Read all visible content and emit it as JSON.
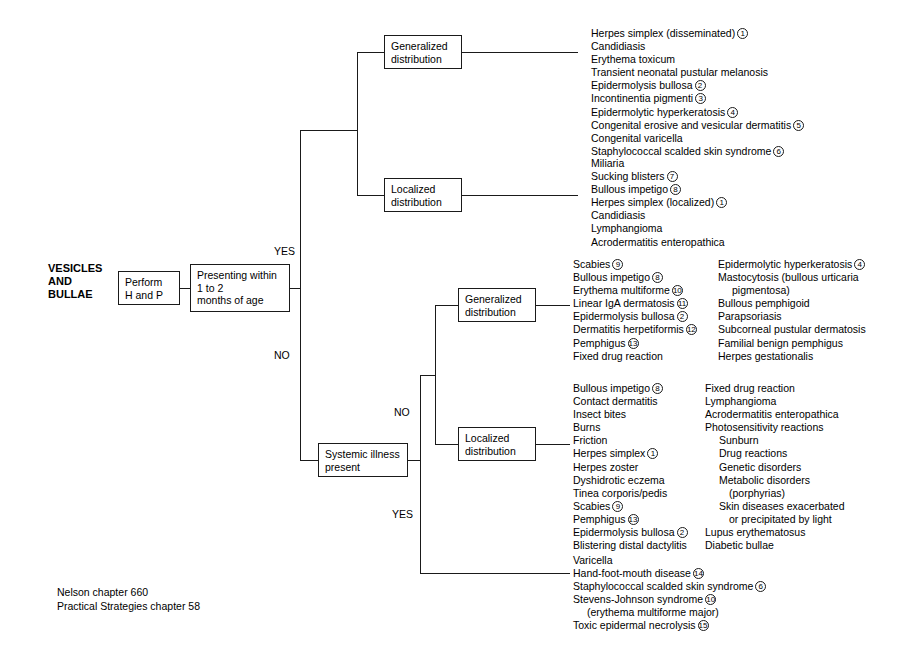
{
  "title_label": "VESICLES\nAND\nBULLAE",
  "nodes": {
    "perform": "Perform\nH and P",
    "presenting": "Presenting within\n1 to 2\nmonths of age",
    "systemic": "Systemic illness\npresent",
    "gen_dist_top": "Generalized\ndistribution",
    "loc_dist_top": "Localized\ndistribution",
    "gen_dist_mid": "Generalized\ndistribution",
    "loc_dist_mid": "Localized\ndistribution"
  },
  "branch_labels": {
    "yes_top": "YES",
    "no_top": "NO",
    "no_mid": "NO",
    "yes_bottom": "YES"
  },
  "lists": {
    "neonatal_generalized": [
      {
        "text": "Herpes simplex (disseminated)",
        "ref": "1",
        "indent": 0
      },
      {
        "text": "Candidiasis",
        "ref": "",
        "indent": 0
      },
      {
        "text": "Erythema toxicum",
        "ref": "",
        "indent": 0
      },
      {
        "text": "Transient neonatal pustular melanosis",
        "ref": "",
        "indent": 0
      },
      {
        "text": "Epidermolysis bullosa",
        "ref": "2",
        "indent": 0
      },
      {
        "text": "Incontinentia pigmenti",
        "ref": "3",
        "indent": 0
      },
      {
        "text": "Epidermolytic hyperkeratosis",
        "ref": "4",
        "indent": 0
      },
      {
        "text": "Congenital erosive and vesicular dermatitis",
        "ref": "5",
        "indent": 0
      },
      {
        "text": "Congenital varicella",
        "ref": "",
        "indent": 0
      },
      {
        "text": "Staphylococcal scalded skin syndrome",
        "ref": "6",
        "indent": 0
      }
    ],
    "neonatal_localized": [
      {
        "text": "Miliaria",
        "ref": "",
        "indent": 0
      },
      {
        "text": "Sucking blisters",
        "ref": "7",
        "indent": 0
      },
      {
        "text": "Bullous impetigo",
        "ref": "8",
        "indent": 0
      },
      {
        "text": "Herpes simplex (localized)",
        "ref": "1",
        "indent": 0
      },
      {
        "text": "Candidiasis",
        "ref": "",
        "indent": 0
      },
      {
        "text": "Lymphangioma",
        "ref": "",
        "indent": 0
      },
      {
        "text": "Acrodermatitis enteropathica",
        "ref": "",
        "indent": 0
      }
    ],
    "generalized_left": [
      {
        "text": "Scabies",
        "ref": "9",
        "indent": 0
      },
      {
        "text": "Bullous impetigo",
        "ref": "8",
        "indent": 0
      },
      {
        "text": "Erythema multiforme",
        "ref": "10",
        "indent": 0
      },
      {
        "text": "Linear IgA dermatosis",
        "ref": "11",
        "indent": 0
      },
      {
        "text": "Epidermolysis bullosa",
        "ref": "2",
        "indent": 0
      },
      {
        "text": "Dermatitis herpetiformis",
        "ref": "12",
        "indent": 0
      },
      {
        "text": "Pemphigus",
        "ref": "13",
        "indent": 0
      },
      {
        "text": "Fixed drug reaction",
        "ref": "",
        "indent": 0
      }
    ],
    "generalized_right": [
      {
        "text": "Epidermolytic hyperkeratosis",
        "ref": "4",
        "indent": 0
      },
      {
        "text": "Mastocytosis (bullous urticaria",
        "ref": "",
        "indent": 0
      },
      {
        "text": "pigmentosa)",
        "ref": "",
        "indent": 1
      },
      {
        "text": "Bullous pemphigoid",
        "ref": "",
        "indent": 0
      },
      {
        "text": "Parapsoriasis",
        "ref": "",
        "indent": 0
      },
      {
        "text": "Subcorneal pustular dermatosis",
        "ref": "",
        "indent": 0
      },
      {
        "text": "Familial benign pemphigus",
        "ref": "",
        "indent": 0
      },
      {
        "text": "Herpes gestationalis",
        "ref": "",
        "indent": 0
      }
    ],
    "localized_left": [
      {
        "text": "Bullous impetigo",
        "ref": "8",
        "indent": 0
      },
      {
        "text": "Contact dermatitis",
        "ref": "",
        "indent": 0
      },
      {
        "text": "Insect bites",
        "ref": "",
        "indent": 0
      },
      {
        "text": "Burns",
        "ref": "",
        "indent": 0
      },
      {
        "text": "Friction",
        "ref": "",
        "indent": 0
      },
      {
        "text": "Herpes simplex",
        "ref": "1",
        "indent": 0
      },
      {
        "text": "Herpes zoster",
        "ref": "",
        "indent": 0
      },
      {
        "text": "Dyshidrotic eczema",
        "ref": "",
        "indent": 0
      },
      {
        "text": "Tinea corporis/pedis",
        "ref": "",
        "indent": 0
      },
      {
        "text": "Scabies",
        "ref": "9",
        "indent": 0
      },
      {
        "text": "Pemphigus",
        "ref": "13",
        "indent": 0
      },
      {
        "text": "Epidermolysis bullosa",
        "ref": "2",
        "indent": 0
      },
      {
        "text": "Blistering distal dactylitis",
        "ref": "",
        "indent": 0
      }
    ],
    "localized_right": [
      {
        "text": "Fixed drug reaction",
        "ref": "",
        "indent": 0
      },
      {
        "text": "Lymphangioma",
        "ref": "",
        "indent": 0
      },
      {
        "text": "Acrodermatitis enteropathica",
        "ref": "",
        "indent": 0
      },
      {
        "text": "Photosensitivity reactions",
        "ref": "",
        "indent": 0
      },
      {
        "text": "Sunburn",
        "ref": "",
        "indent": 1
      },
      {
        "text": "Drug reactions",
        "ref": "",
        "indent": 1
      },
      {
        "text": "Genetic disorders",
        "ref": "",
        "indent": 1
      },
      {
        "text": "Metabolic disorders",
        "ref": "",
        "indent": 1
      },
      {
        "text": "(porphyrias)",
        "ref": "",
        "indent": 2
      },
      {
        "text": "Skin diseases exacerbated",
        "ref": "",
        "indent": 1
      },
      {
        "text": "or precipitated by light",
        "ref": "",
        "indent": 2
      },
      {
        "text": "Lupus erythematosus",
        "ref": "",
        "indent": 0
      },
      {
        "text": "Diabetic bullae",
        "ref": "",
        "indent": 0
      }
    ],
    "systemic_yes": [
      {
        "text": "Varicella",
        "ref": "",
        "indent": 0
      },
      {
        "text": "Hand-foot-mouth disease",
        "ref": "14",
        "indent": 0
      },
      {
        "text": "Staphylococcal scalded skin syndrome",
        "ref": "6",
        "indent": 0
      },
      {
        "text": "Stevens-Johnson syndrome",
        "ref": "10",
        "indent": 0
      },
      {
        "text": "(erythema multiforme major)",
        "ref": "",
        "indent": 1
      },
      {
        "text": "Toxic epidermal necrolysis",
        "ref": "15",
        "indent": 0
      }
    ]
  },
  "footer": "Nelson chapter 660\nPractical Strategies chapter 58"
}
